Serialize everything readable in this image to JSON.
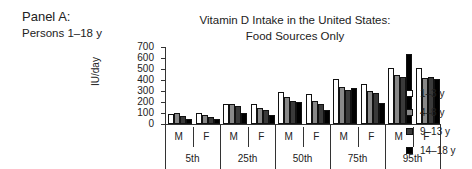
{
  "panel": {
    "title": "Panel A:",
    "subtitle": "Persons 1–18 y"
  },
  "chart_data": {
    "type": "bar",
    "title": "Vitamin D Intake in the United States: Food Sources Only",
    "title_lines": [
      "Vitamin D Intake in the United States:",
      "Food Sources Only"
    ],
    "xlabel": "",
    "ylabel": "IU/day",
    "ylim": [
      0,
      700
    ],
    "yticks": [
      "700",
      "600",
      "500",
      "400",
      "300",
      "200",
      "100",
      "0"
    ],
    "grid": false,
    "legend_position": "right",
    "percentiles": [
      "5th",
      "25th",
      "50th",
      "75th",
      "95th"
    ],
    "sexes": [
      "M",
      "F"
    ],
    "categories": [
      "5th M",
      "5th F",
      "25th M",
      "25th F",
      "50th M",
      "50th F",
      "75th M",
      "75th F",
      "95th M",
      "95th F"
    ],
    "series": [
      {
        "name": "1–3 y",
        "color": "#ffffff",
        "values": [
          90,
          100,
          185,
          185,
          290,
          270,
          410,
          360,
          510,
          510
        ]
      },
      {
        "name": "4–8 y",
        "color": "#888888",
        "values": [
          100,
          85,
          185,
          150,
          245,
          210,
          340,
          300,
          450,
          420
        ]
      },
      {
        "name": "9–13 y",
        "color": "#3a3a3a",
        "values": [
          70,
          60,
          160,
          125,
          210,
          185,
          310,
          280,
          430,
          430
        ]
      },
      {
        "name": "14–18 y",
        "color": "#000000",
        "values": [
          50,
          45,
          100,
          80,
          200,
          130,
          330,
          195,
          640,
          405
        ]
      }
    ]
  }
}
